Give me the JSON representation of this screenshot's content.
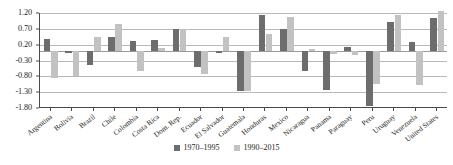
{
  "chart_data": {
    "type": "bar",
    "title": "",
    "subtitle": "",
    "xlabel": "",
    "ylabel": "",
    "ylim": [
      -1.8,
      1.2
    ],
    "yticks": [
      1.2,
      0.7,
      0.2,
      -0.3,
      -0.8,
      -1.3,
      -1.8
    ],
    "ytick_labels": [
      "1.20",
      "0.70",
      "0.20",
      "-0.30",
      "-0.80",
      "-1.30",
      "-1.80"
    ],
    "grid": true,
    "legend_position": "bottom-center",
    "categories": [
      "Argentina",
      "Bolivia",
      "Brazil",
      "Chile",
      "Colombia",
      "Costa Rica",
      "Dom. Rep.",
      "Ecuador",
      "El Salvador",
      "Guatemala",
      "Honduras",
      "Mexico",
      "Nicaragua",
      "Panama",
      "Paraguay",
      "Peru",
      "Uruguay",
      "Venezuela",
      "United States"
    ],
    "series": [
      {
        "name": "1970–1995",
        "color": "#6d6d6d",
        "values": [
          0.38,
          -0.06,
          -0.45,
          0.43,
          0.33,
          0.36,
          0.7,
          -0.5,
          -0.06,
          -1.26,
          1.13,
          0.7,
          -0.62,
          -1.22,
          0.12,
          -1.75,
          0.93,
          0.27,
          1.05
        ]
      },
      {
        "name": "1990–2015",
        "color": "#c2c2c2",
        "values": [
          -0.85,
          -0.78,
          0.45,
          0.86,
          -0.62,
          0.1,
          0.71,
          -0.72,
          0.45,
          -1.26,
          0.55,
          1.08,
          0.05,
          -0.08,
          -0.12,
          -1.05,
          1.15,
          -1.08,
          1.25
        ]
      }
    ]
  },
  "legend": {
    "items": [
      {
        "label": "1970–1995",
        "color": "#6d6d6d"
      },
      {
        "label": "1990–2015",
        "color": "#c2c2c2"
      }
    ]
  }
}
